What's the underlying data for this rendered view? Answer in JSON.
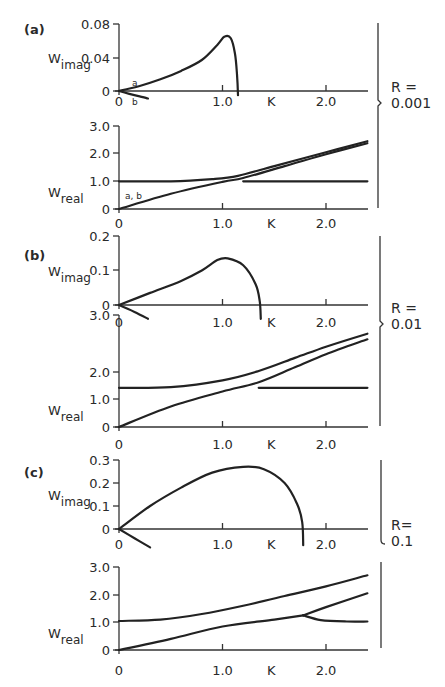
{
  "chart_data": [
    {
      "panel": "(a)",
      "R_label": "R =",
      "R_value": "0.001",
      "subplots": [
        {
          "type": "line",
          "ylabel": "W",
          "ylabel_sub": "imag",
          "xlabel": "K",
          "xticks": [
            "0",
            "1.0",
            "2.0"
          ],
          "yticks": [
            "0",
            "0.04",
            "0.08"
          ],
          "ylim": [
            0,
            0.08
          ],
          "xlim": [
            0,
            2.4
          ],
          "annotations": [
            "a",
            "b"
          ],
          "series": [
            {
              "name": "a",
              "x": [
                0,
                0.2,
                0.4,
                0.6,
                0.8,
                0.95,
                1.02,
                1.08,
                1.12,
                1.14,
                1.15
              ],
              "y": [
                0,
                0.006,
                0.014,
                0.024,
                0.037,
                0.055,
                0.065,
                0.063,
                0.045,
                0.02,
                -0.005
              ]
            },
            {
              "name": "b",
              "x": [
                0,
                0.1,
                0.2,
                0.28
              ],
              "y": [
                0,
                -0.0035,
                -0.0065,
                -0.009
              ]
            }
          ]
        },
        {
          "type": "line",
          "ylabel": "W",
          "ylabel_sub": "real",
          "xlabel": "K",
          "xticks": [
            "0",
            "1.0",
            "2.0"
          ],
          "yticks": [
            "0",
            "1.0",
            "2.0",
            "3.0"
          ],
          "ylim": [
            0,
            3.0
          ],
          "xlim": [
            0,
            2.4
          ],
          "annotations": [
            "a, b"
          ],
          "series": [
            {
              "name": "upper",
              "x": [
                0,
                0.5,
                0.9,
                1.15,
                1.5,
                2.0,
                2.4
              ],
              "y": [
                1.0,
                1.0,
                1.08,
                1.2,
                1.55,
                2.05,
                2.45
              ]
            },
            {
              "name": "a,b",
              "x": [
                0,
                0.5,
                1.0,
                1.2,
                1.6,
                2.0,
                2.4
              ],
              "y": [
                0,
                0.55,
                0.98,
                1.12,
                1.55,
                1.98,
                2.38
              ]
            },
            {
              "name": "flat",
              "x": [
                1.2,
                1.6,
                2.0,
                2.4
              ],
              "y": [
                1.0,
                1.0,
                1.0,
                1.0
              ]
            }
          ]
        }
      ]
    },
    {
      "panel": "(b)",
      "R_label": "R =",
      "R_value": "0.01",
      "subplots": [
        {
          "type": "line",
          "ylabel": "W",
          "ylabel_sub": "imag",
          "xlabel": "K",
          "xticks": [
            "0",
            "1.0",
            "2.0"
          ],
          "yticks": [
            "0",
            "0.1",
            "0.2"
          ],
          "ylim": [
            0,
            0.2
          ],
          "xlim": [
            0,
            2.4
          ],
          "series": [
            {
              "name": "unstable",
              "x": [
                0,
                0.3,
                0.6,
                0.8,
                0.95,
                1.05,
                1.2,
                1.32,
                1.36,
                1.37
              ],
              "y": [
                0,
                0.035,
                0.07,
                0.1,
                0.13,
                0.135,
                0.115,
                0.06,
                0.01,
                -0.04
              ]
            },
            {
              "name": "damped",
              "x": [
                0,
                0.15,
                0.28
              ],
              "y": [
                0,
                -0.02,
                -0.04
              ]
            }
          ]
        },
        {
          "type": "line",
          "ylabel": "W",
          "ylabel_sub": "real",
          "xlabel": "K",
          "xticks": [
            "0",
            "1.0",
            "2.0"
          ],
          "yticks": [
            "0",
            "1.0",
            "2.0",
            "3.0"
          ],
          "ylim": [
            0,
            3.0
          ],
          "xlim": [
            0,
            2.4
          ],
          "series": [
            {
              "name": "upper",
              "x": [
                0,
                0.5,
                1.0,
                1.35,
                1.7,
                2.0,
                2.4
              ],
              "y": [
                1.05,
                1.07,
                1.25,
                1.5,
                1.85,
                2.15,
                2.5
              ]
            },
            {
              "name": "lower",
              "x": [
                0,
                0.5,
                1.0,
                1.35,
                1.7,
                2.0,
                2.4
              ],
              "y": [
                0,
                0.55,
                0.95,
                1.2,
                1.6,
                1.95,
                2.35
              ]
            },
            {
              "name": "flat",
              "x": [
                1.35,
                1.8,
                2.4
              ],
              "y": [
                1.05,
                1.05,
                1.05
              ]
            }
          ]
        }
      ]
    },
    {
      "panel": "(c)",
      "R_label": "R=",
      "R_value": "0.1",
      "subplots": [
        {
          "type": "line",
          "ylabel": "W",
          "ylabel_sub": "imag",
          "xlabel": "K",
          "xticks": [
            "0",
            "1.0",
            "2.0"
          ],
          "yticks": [
            "0",
            "0.1",
            "0.2",
            "0.3"
          ],
          "ylim": [
            0,
            0.3
          ],
          "xlim": [
            0,
            2.4
          ],
          "series": [
            {
              "name": "unstable",
              "x": [
                0,
                0.3,
                0.6,
                0.9,
                1.2,
                1.4,
                1.6,
                1.72,
                1.77,
                1.78
              ],
              "y": [
                0,
                0.1,
                0.18,
                0.245,
                0.27,
                0.26,
                0.2,
                0.11,
                0.03,
                -0.07
              ]
            },
            {
              "name": "damped",
              "x": [
                0,
                0.15,
                0.3
              ],
              "y": [
                0,
                -0.04,
                -0.08
              ]
            }
          ]
        },
        {
          "type": "line",
          "ylabel": "W",
          "ylabel_sub": "real",
          "xlabel": "K",
          "xticks": [
            "0",
            "1.0",
            "2.0"
          ],
          "yticks": [
            "0",
            "1.0",
            "2.0",
            "3.0"
          ],
          "ylim": [
            0,
            3.0
          ],
          "xlim": [
            0,
            2.4
          ],
          "series": [
            {
              "name": "upper",
              "x": [
                0,
                0.4,
                0.8,
                1.2,
                1.6,
                2.0,
                2.4
              ],
              "y": [
                1.05,
                1.1,
                1.3,
                1.6,
                1.95,
                2.3,
                2.7
              ]
            },
            {
              "name": "lower",
              "x": [
                0,
                0.5,
                1.0,
                1.5,
                1.78
              ],
              "y": [
                0,
                0.4,
                0.85,
                1.1,
                1.25
              ]
            },
            {
              "name": "branch-up",
              "x": [
                1.78,
                2.0,
                2.4
              ],
              "y": [
                1.25,
                1.55,
                2.05
              ]
            },
            {
              "name": "branch-down",
              "x": [
                1.78,
                1.95,
                2.2,
                2.4
              ],
              "y": [
                1.25,
                1.08,
                1.03,
                1.03
              ]
            }
          ]
        }
      ]
    }
  ]
}
